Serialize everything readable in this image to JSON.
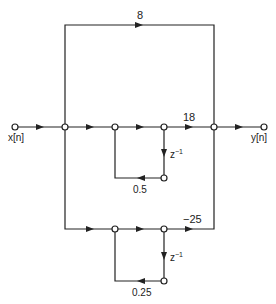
{
  "labels": {
    "input": "x[n]",
    "output": "y[n]",
    "gain_top": "8",
    "gain_mid": "18",
    "gain_bot": "−25",
    "delay1": "z",
    "delay2": "z",
    "exp": "−1",
    "fb1": "0.5",
    "fb2": "0.25"
  }
}
